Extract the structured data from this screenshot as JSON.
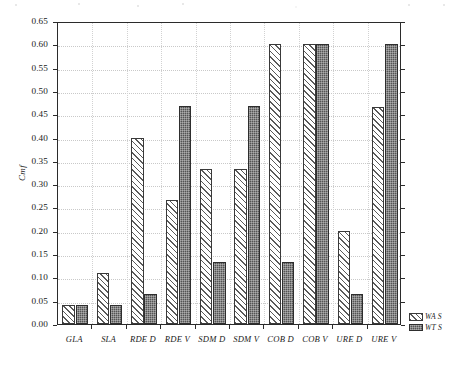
{
  "chart_data": {
    "type": "bar",
    "title": "",
    "subtitle": "",
    "xlabel": "",
    "ylabel": "Cmf",
    "categories": [
      "GLA",
      "SLA",
      "RDE D",
      "RDE V",
      "SDM D",
      "SDM V",
      "COB D",
      "COB V",
      "URE D",
      "URE V"
    ],
    "series": [
      {
        "name": "WA S",
        "pattern": "diagonal-hatch",
        "color": "#ffffff",
        "edge_color": "#3a3a3a",
        "values": [
          0.04,
          0.11,
          0.4,
          0.265,
          0.333,
          0.333,
          0.6,
          0.6,
          0.2,
          0.465
        ]
      },
      {
        "name": "WT S",
        "pattern": "dark-stipple",
        "color": "#545454",
        "edge_color": "#2e2e2e",
        "values": [
          0.04,
          0.04,
          0.065,
          0.467,
          0.133,
          0.467,
          0.133,
          0.6,
          0.065,
          0.6
        ]
      }
    ],
    "ylim": [
      0.0,
      0.65
    ],
    "ytick_step": 0.05,
    "yticks": [
      "0.00",
      "0.05",
      "0.10",
      "0.15",
      "0.20",
      "0.25",
      "0.30",
      "0.35",
      "0.40",
      "0.45",
      "0.50",
      "0.55",
      "0.60",
      "0.65"
    ],
    "grid": "horizontal-and-vertical-dotted",
    "legend_position": "bottom-right-outside",
    "legend": [
      {
        "label": "WA S",
        "swatch": "diagonal-hatch"
      },
      {
        "label": "WT S",
        "swatch": "dark-stipple"
      }
    ]
  }
}
